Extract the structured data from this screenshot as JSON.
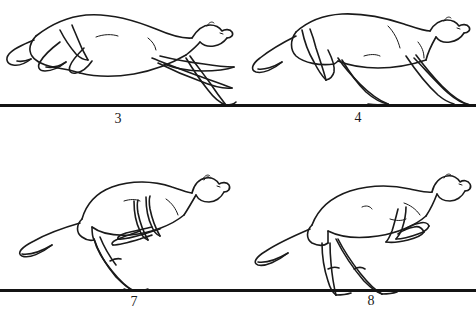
{
  "figure": {
    "background_color": "#ffffff",
    "line_color": "#1a1a1a",
    "width": 476,
    "height": 313
  },
  "panels": [
    {
      "id": "panel-3",
      "label": "3",
      "subject": "cheetah",
      "pose": "fully extended airborne stride, forelegs stretched forward, hind legs tucked under body, tail curving back and down",
      "ground_contact": "right forepaw just touching ground",
      "row": 1,
      "column": 1
    },
    {
      "id": "panel-4",
      "label": "4",
      "subject": "cheetah",
      "pose": "forelimb landing phase, front legs planted and hind legs trailing, body nearly level, tail extended straight behind",
      "ground_contact": "both forepaws and one hind paw on ground",
      "row": 1,
      "column": 2
    },
    {
      "id": "panel-7",
      "label": "7",
      "subject": "cheetah",
      "pose": "hind-limb propulsion, back arched upward, forelegs folded under chest, single hind leg driving against the ground, tail raised behind",
      "ground_contact": "one hind paw on ground",
      "row": 2,
      "column": 1
    },
    {
      "id": "panel-8",
      "label": "8",
      "subject": "cheetah",
      "pose": "push-off with hind legs spread, forelegs folded and reaching forward, back flattening, tail streaming behind",
      "ground_contact": "two hind paws on ground",
      "row": 2,
      "column": 2
    }
  ],
  "ground_lines": [
    {
      "id": "ground-top",
      "y": 104,
      "label_left": "3",
      "label_right": "4"
    },
    {
      "id": "ground-bottom",
      "y": 289,
      "label_left": "7",
      "label_right": "8"
    }
  ]
}
